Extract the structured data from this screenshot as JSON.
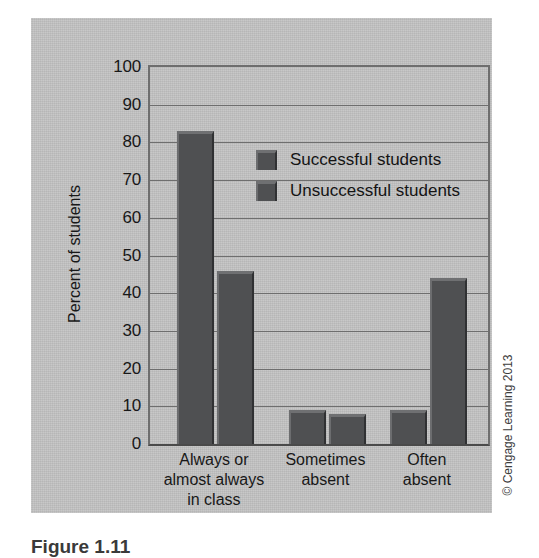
{
  "figure": {
    "caption": "Figure 1.11",
    "copyright": "© Cengage Learning 2013"
  },
  "colors": {
    "panel_background": "#c3c3c3",
    "bar_fill": "#4f5052",
    "bar_highlight": "#6f7072",
    "bar_shadow": "#303133",
    "gridline": "#6e6e6e",
    "axis": "#4a4a4a",
    "text": "#181818"
  },
  "chart_data": {
    "type": "bar",
    "title": "",
    "subtitle": "",
    "xlabel": "",
    "ylabel": "Percent of students",
    "ylim": [
      0,
      100
    ],
    "yticks": [
      0,
      10,
      20,
      30,
      40,
      50,
      60,
      70,
      80,
      90,
      100
    ],
    "ytick_labels": [
      "0",
      "10",
      "20",
      "30",
      "40",
      "50",
      "60",
      "70",
      "80",
      "90",
      "100"
    ],
    "grid": true,
    "legend_position": "upper center inside plot",
    "categories": [
      "Always or almost always in class",
      "Sometimes absent",
      "Often absent"
    ],
    "category_label_lines": [
      [
        "Always or",
        "almost always",
        "in class"
      ],
      [
        "Sometimes",
        "absent"
      ],
      [
        "Often",
        "absent"
      ]
    ],
    "series": [
      {
        "name": "Successful students",
        "values": [
          83,
          9,
          9
        ]
      },
      {
        "name": "Unsuccessful students",
        "values": [
          46,
          8,
          44
        ]
      }
    ]
  }
}
